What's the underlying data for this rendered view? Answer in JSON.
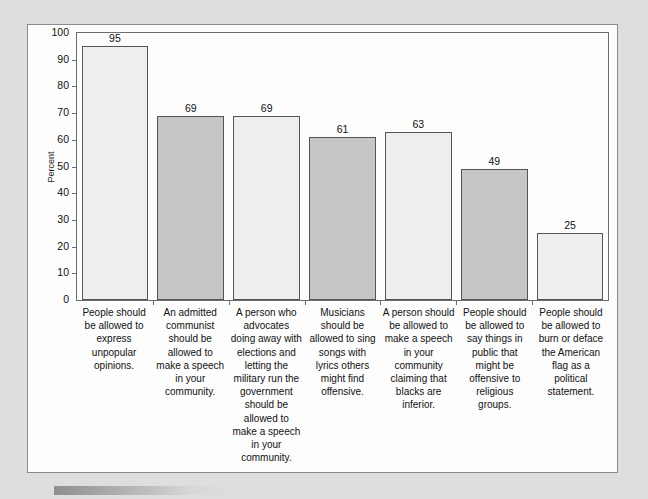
{
  "chart_data": {
    "type": "bar",
    "title": "",
    "xlabel": "",
    "ylabel": "Percent",
    "ylim": [
      0,
      100
    ],
    "ytick_labels": [
      "100",
      "90",
      "80",
      "70",
      "60",
      "50",
      "40",
      "30",
      "20",
      "10",
      "0"
    ],
    "ytick_values": [
      100,
      90,
      80,
      70,
      60,
      50,
      40,
      30,
      20,
      10,
      0
    ],
    "grid": false,
    "legend": "none",
    "categories": [
      "People should be allowed to express unpopular opinions.",
      "An admitted communist should be allowed to make a speech in your community.",
      "A person who advocates doing away with elections and letting the military run the government should be allowed to make a speech in your community.",
      "Musicians should be allowed to sing songs with lyrics others might find offensive.",
      "A person should be allowed to make a speech in your community claiming that blacks are inferior.",
      "People should be allowed to say things in public that might be offensive to religious groups.",
      "People should be allowed to burn or deface the American flag as a political statement."
    ],
    "values": [
      95,
      69,
      69,
      61,
      63,
      49,
      25
    ],
    "value_labels": [
      "95",
      "69",
      "69",
      "61",
      "63",
      "49",
      "25"
    ],
    "bar_shades": [
      "light",
      "dark",
      "light",
      "dark",
      "light",
      "dark",
      "light"
    ],
    "colors": {
      "bar_light": "#eeeeee",
      "bar_dark": "#c6c6c6",
      "bar_outline": "#555555",
      "axis": "#6d6d6d",
      "text": "#111111",
      "panel_background": "#fdfdfd",
      "page_background": "#dcdcdc"
    }
  }
}
